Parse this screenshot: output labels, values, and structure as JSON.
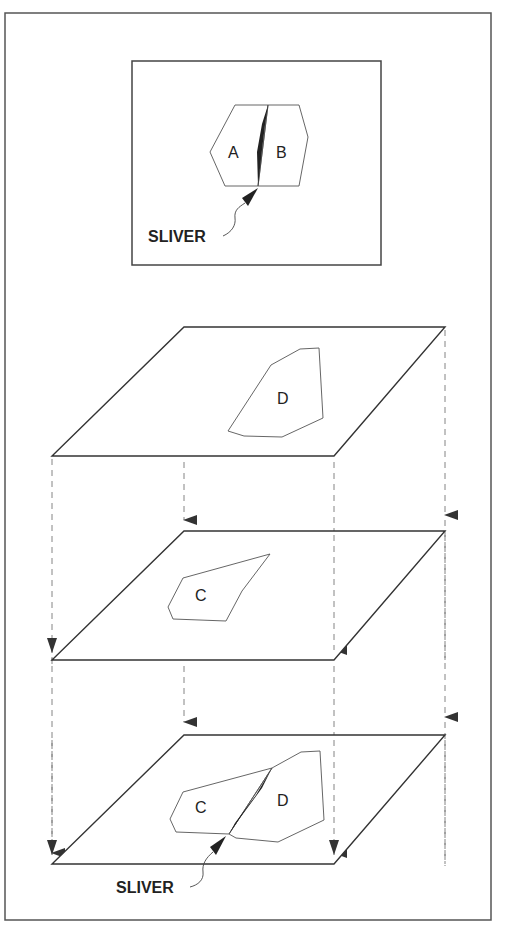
{
  "figure": {
    "type": "overlay-sliver-diagram",
    "colors": {
      "stroke": "#333333",
      "polygon_stroke": "#555555",
      "sliver_fill": "#222222",
      "dash": "#777777",
      "background": "#ffffff"
    }
  },
  "inset": {
    "polygons": [
      {
        "id": "A",
        "label": "A"
      },
      {
        "id": "B",
        "label": "B"
      }
    ],
    "callout": "SLIVER"
  },
  "layers": [
    {
      "id": "layer-1",
      "polygon_label": "D"
    },
    {
      "id": "layer-2",
      "polygon_label": "C"
    },
    {
      "id": "layer-3",
      "polygon_labels": [
        "C",
        "D"
      ],
      "callout": "SLIVER"
    }
  ]
}
